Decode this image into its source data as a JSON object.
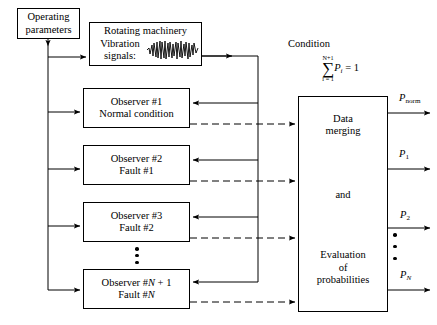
{
  "diagram": {
    "title_semantic": "observer-bank-fault-diagnosis-block-diagram",
    "operating_parameters": {
      "line1": "Operating",
      "line2": "parameters"
    },
    "rotating_machinery": {
      "title": "Rotating machinery",
      "vibration_line1": "Vibration",
      "vibration_line2": "signals:",
      "waveform_icon": "vibration-waveform-icon"
    },
    "observers": [
      {
        "line1": "Observer #1",
        "line2": "Normal condition"
      },
      {
        "line1": "Observer #2",
        "line2": "Fault #1"
      },
      {
        "line1": "Observer #3",
        "line2": "Fault #2"
      },
      {
        "line1": "Observer #N + 1",
        "line2": "Fault #N"
      }
    ],
    "observer_ellipsis": "vertical-dots",
    "condition_label": "Condition",
    "sum_formula": {
      "upper_limit": "N+1",
      "sigma": "∑",
      "lower_limit": "i = 1",
      "body": "P",
      "body_subscript": "i",
      "equals": "= 1",
      "plain": "∑(i=1 to N+1) P_i = 1"
    },
    "merge_box": {
      "line1": "Data",
      "line2": "merging",
      "line3": "and",
      "line4": "Evaluation",
      "line5": "of",
      "line6": "probabilities"
    },
    "outputs": [
      {
        "symbol": "P",
        "subscript": "norm"
      },
      {
        "symbol": "P",
        "subscript": "1"
      },
      {
        "symbol": "P",
        "subscript": "2"
      },
      {
        "symbol": "P",
        "subscript": "N"
      }
    ],
    "output_ellipsis": "vertical-dots",
    "colors": {
      "stroke": "#000000",
      "background": "#ffffff",
      "text": "#000000"
    }
  }
}
